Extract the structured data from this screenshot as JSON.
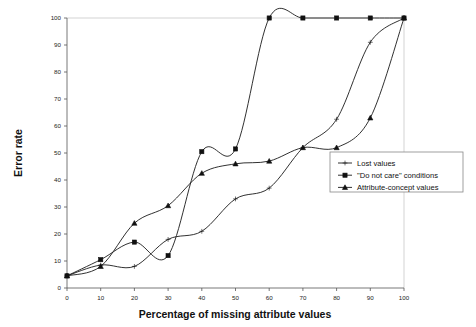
{
  "chart_data": {
    "type": "line",
    "title": "",
    "xlabel": "Percentage of missing attribute values",
    "ylabel": "Error rate",
    "xlim": [
      0,
      100
    ],
    "ylim": [
      0,
      100
    ],
    "xticks": [
      "0",
      "10",
      "20",
      "30",
      "40",
      "50",
      "60",
      "70",
      "80",
      "90",
      "100"
    ],
    "yticks": [
      "0",
      "10",
      "20",
      "30",
      "40",
      "50",
      "60",
      "70",
      "80",
      "90",
      "100"
    ],
    "grid": false,
    "legend_position": "right-middle",
    "x": [
      0,
      10,
      20,
      30,
      40,
      50,
      60,
      70,
      80,
      90,
      100
    ],
    "series": [
      {
        "name": "Lost values",
        "marker": "plus",
        "values": [
          4.5,
          8.5,
          8,
          18,
          21,
          33,
          37,
          52,
          62.5,
          91,
          100
        ]
      },
      {
        "name": "\"Do not care\" conditions",
        "marker": "square",
        "values": [
          4.5,
          10.5,
          17,
          12,
          50.5,
          51.5,
          100,
          100,
          100,
          100,
          100
        ]
      },
      {
        "name": "Attribute-concept values",
        "marker": "triangle",
        "values": [
          4.5,
          8,
          24,
          30.5,
          42.5,
          46,
          47,
          52,
          52,
          63,
          100
        ]
      }
    ]
  },
  "legend": {
    "items": [
      {
        "label": "Lost values"
      },
      {
        "label": "\"Do not care\" conditions"
      },
      {
        "label": "Attribute-concept values"
      }
    ]
  }
}
